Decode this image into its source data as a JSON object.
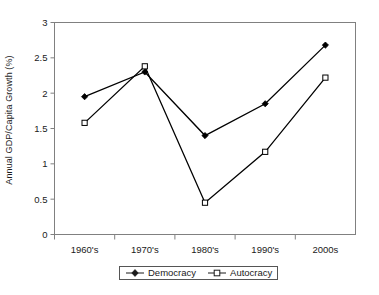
{
  "chart_data": {
    "type": "line",
    "title": "",
    "xlabel": "",
    "ylabel": "Annual GDP/Capita Growth (%)",
    "categories": [
      "1960's",
      "1970's",
      "1980's",
      "1990's",
      "2000s"
    ],
    "ylim": [
      0,
      3
    ],
    "ytick_labels": [
      "0",
      "0.5",
      "1",
      "1.5",
      "2",
      "2.5",
      "3"
    ],
    "ytick_values": [
      0,
      0.5,
      1,
      1.5,
      2,
      2.5,
      3
    ],
    "grid": false,
    "legend_position": "bottom-center",
    "series": [
      {
        "name": "Democracy",
        "marker": "filled-diamond",
        "color": "#000000",
        "values": [
          1.95,
          2.3,
          1.4,
          1.85,
          2.68
        ]
      },
      {
        "name": "Autocracy",
        "marker": "open-square",
        "color": "#000000",
        "values": [
          1.58,
          2.38,
          0.45,
          1.17,
          2.22
        ]
      }
    ]
  },
  "legend": {
    "items": [
      {
        "label": "Democracy",
        "marker": "filled-diamond"
      },
      {
        "label": "Autocracy",
        "marker": "open-square"
      }
    ]
  },
  "axis": {
    "y_title": "Annual GDP/Capita Growth (%)"
  },
  "colors": {
    "line": "#1a1a1a",
    "frame": "#808080",
    "text": "#1a1a1a",
    "background": "#ffffff"
  }
}
